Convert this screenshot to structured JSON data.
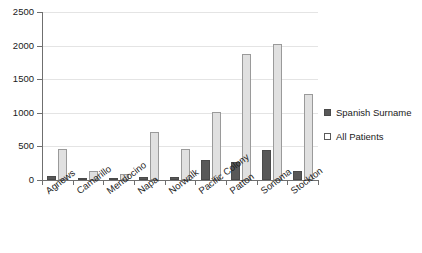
{
  "chart_data": {
    "type": "bar",
    "title": "",
    "subtitle": "",
    "xlabel": "",
    "ylabel": "",
    "ylim": [
      0,
      2500
    ],
    "yticks": [
      0,
      500,
      1000,
      1500,
      2000,
      2500
    ],
    "ytick_labels": [
      "0",
      "500",
      "1000",
      "1500",
      "2000",
      "2500"
    ],
    "grid": true,
    "legend_position": "right",
    "categories": [
      "Agnews",
      "Camarillo",
      "Mendocino",
      "Napa",
      "Norwalk",
      "Pacific Colony",
      "Patton",
      "Sonoma",
      "Stockton"
    ],
    "series": [
      {
        "name": "Spanish Surname",
        "color": "#585858",
        "values": [
          65,
          20,
          15,
          45,
          50,
          300,
          270,
          445,
          140
        ]
      },
      {
        "name": "All Patients",
        "color": "#e0e0e0",
        "values": [
          465,
          140,
          95,
          715,
          460,
          1005,
          1870,
          2025,
          1275
        ]
      }
    ]
  },
  "legend": {
    "items": [
      {
        "label": "Spanish Surname",
        "swatch": "dark"
      },
      {
        "label": "All Patients",
        "swatch": "light"
      }
    ]
  }
}
